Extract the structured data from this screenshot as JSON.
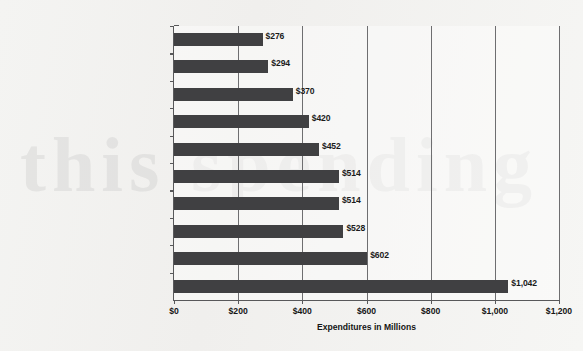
{
  "chart_data": {
    "type": "bar",
    "orientation": "horizontal",
    "title": "",
    "xlabel": "Expenditures in Millions",
    "ylabel": "",
    "xlim": [
      0,
      1200
    ],
    "xticks": [
      0,
      200,
      400,
      600,
      800,
      1000,
      1200
    ],
    "xtick_labels": [
      "$0",
      "$200",
      "$400",
      "$600",
      "$800",
      "$1,000",
      "$1,200"
    ],
    "grid": true,
    "grid_axis": "x",
    "legend": false,
    "bar_color": "#404042",
    "categories": [
      "Government, politics, and nonprofits",
      "Automotive dealers & services",
      "Financial",
      "Insurance & real estate",
      "Media & advertising",
      "Communications",
      "Restaurants",
      "Retail",
      "Transportation, hotels, & resorts",
      "Services & amusements"
    ],
    "values": [
      276,
      294,
      370,
      420,
      452,
      514,
      514,
      528,
      602,
      1042
    ],
    "data_labels": [
      "$276",
      "$294",
      "$370",
      "$420",
      "$452",
      "$514",
      "$514",
      "$528",
      "$602",
      "$1,042"
    ]
  },
  "watermark": {
    "text": "this spending"
  }
}
